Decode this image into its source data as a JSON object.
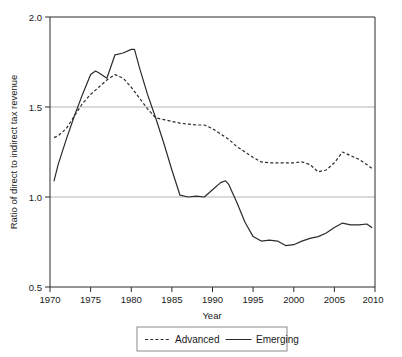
{
  "chart_data": {
    "type": "line",
    "title": "",
    "xlabel": "Year",
    "ylabel": "Ratio of direct to indirect tax revenue",
    "xlim": [
      1970,
      2010
    ],
    "ylim": [
      0.5,
      2.0
    ],
    "xticks": [
      1970,
      1975,
      1980,
      1985,
      1990,
      1995,
      2000,
      2005,
      2010
    ],
    "xtick_labels": [
      "1970",
      "1975",
      "1980",
      "1985",
      "1990",
      "1995",
      "2000",
      "2005",
      "2010"
    ],
    "yticks": [
      0.5,
      1.0,
      1.5,
      2.0
    ],
    "ytick_labels": [
      "0.5",
      "1.0",
      "1.5",
      "2.0"
    ],
    "grid": "horizontal gridlines at 1.0 and 1.5",
    "legend_position": "below plot, centered, boxed",
    "series": [
      {
        "name": "Advanced",
        "style": "dashed",
        "color": "#2b2b2b",
        "x": [
          1970.5,
          1971,
          1972,
          1973,
          1974,
          1975,
          1976,
          1977,
          1978,
          1979,
          1980,
          1981,
          1982,
          1983,
          1984,
          1985,
          1986,
          1987,
          1988,
          1989,
          1990,
          1991,
          1992,
          1993,
          1994,
          1995,
          1996,
          1997,
          1998,
          1999,
          2000,
          2001,
          2002,
          2003,
          2004,
          2005,
          2006,
          2007,
          2008,
          2009,
          2009.6
        ],
        "values": [
          1.33,
          1.34,
          1.38,
          1.45,
          1.52,
          1.57,
          1.61,
          1.65,
          1.68,
          1.66,
          1.61,
          1.55,
          1.49,
          1.44,
          1.43,
          1.42,
          1.41,
          1.405,
          1.4,
          1.4,
          1.38,
          1.35,
          1.32,
          1.28,
          1.25,
          1.22,
          1.195,
          1.19,
          1.19,
          1.19,
          1.19,
          1.195,
          1.18,
          1.14,
          1.15,
          1.19,
          1.25,
          1.23,
          1.21,
          1.18,
          1.16
        ]
      },
      {
        "name": "Emerging",
        "style": "solid",
        "color": "#2b2b2b",
        "x": [
          1970.5,
          1971,
          1972,
          1973,
          1974,
          1975,
          1975.6,
          1976,
          1977,
          1978,
          1979,
          1980,
          1980.4,
          1981,
          1982,
          1983,
          1984,
          1985,
          1986,
          1987,
          1988,
          1989,
          1990,
          1991,
          1991.6,
          1992,
          1993,
          1994,
          1995,
          1996,
          1997,
          1998,
          1999,
          2000,
          2001,
          2002,
          2003,
          2004,
          2005,
          2006,
          2007,
          2008,
          2009,
          2009.6
        ],
        "values": [
          1.09,
          1.18,
          1.32,
          1.45,
          1.57,
          1.68,
          1.7,
          1.69,
          1.66,
          1.79,
          1.8,
          1.82,
          1.82,
          1.72,
          1.57,
          1.44,
          1.3,
          1.15,
          1.01,
          1.0,
          1.005,
          1.0,
          1.04,
          1.08,
          1.09,
          1.07,
          0.97,
          0.86,
          0.78,
          0.755,
          0.76,
          0.755,
          0.73,
          0.735,
          0.755,
          0.77,
          0.78,
          0.8,
          0.83,
          0.855,
          0.845,
          0.845,
          0.85,
          0.83
        ]
      }
    ]
  },
  "legend": {
    "items": [
      {
        "label": "Advanced",
        "style": "dashed"
      },
      {
        "label": "Emerging",
        "style": "solid"
      }
    ]
  },
  "colors": {
    "line": "#2b2b2b",
    "grid": "#b5b5b5",
    "axis": "#2b2b2b",
    "legend_border": "#8a8a8a",
    "background": "#ffffff"
  }
}
